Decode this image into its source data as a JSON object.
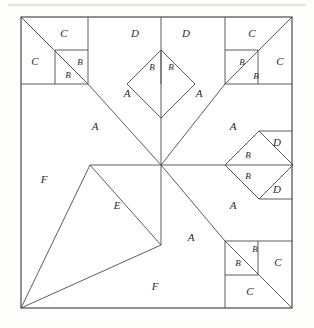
{
  "figure": {
    "background_color": "#fdfdfc",
    "line_color": "#3a3a3a",
    "label_color": "#2a2a2a",
    "outer_square": {
      "x": 21,
      "y": 17,
      "size": 271
    },
    "center_point": {
      "x": 161,
      "y": 165
    },
    "top_rule_y": 5
  },
  "labels": [
    {
      "id": "l01",
      "text": "C",
      "x": 64,
      "y": 34,
      "size": "normal"
    },
    {
      "id": "l02",
      "text": "C",
      "x": 35,
      "y": 62,
      "size": "normal"
    },
    {
      "id": "l03",
      "text": "B",
      "x": 80,
      "y": 63,
      "size": "small"
    },
    {
      "id": "l04",
      "text": "B",
      "x": 68,
      "y": 76,
      "size": "small"
    },
    {
      "id": "l05",
      "text": "D",
      "x": 135,
      "y": 34,
      "size": "normal"
    },
    {
      "id": "l06",
      "text": "D",
      "x": 186,
      "y": 34,
      "size": "normal"
    },
    {
      "id": "l07",
      "text": "B",
      "x": 153,
      "y": 67,
      "size": "small"
    },
    {
      "id": "l08",
      "text": "B",
      "x": 171,
      "y": 67,
      "size": "small"
    },
    {
      "id": "l09",
      "text": "C",
      "x": 252,
      "y": 34,
      "size": "normal"
    },
    {
      "id": "l10",
      "text": "C",
      "x": 280,
      "y": 62,
      "size": "normal"
    },
    {
      "id": "l11",
      "text": "B",
      "x": 243,
      "y": 63,
      "size": "small"
    },
    {
      "id": "l12",
      "text": "B",
      "x": 256,
      "y": 77,
      "size": "small"
    },
    {
      "id": "l13",
      "text": "A",
      "x": 127,
      "y": 94,
      "size": "normal"
    },
    {
      "id": "l14",
      "text": "A",
      "x": 199,
      "y": 94,
      "size": "normal"
    },
    {
      "id": "l15",
      "text": "A",
      "x": 95,
      "y": 127,
      "size": "normal"
    },
    {
      "id": "l16",
      "text": "A",
      "x": 233,
      "y": 127,
      "size": "normal"
    },
    {
      "id": "l17",
      "text": "D",
      "x": 277,
      "y": 143,
      "size": "normal"
    },
    {
      "id": "l18",
      "text": "B",
      "x": 240,
      "y": 156,
      "size": "small"
    },
    {
      "id": "l19",
      "text": "B",
      "x": 240,
      "y": 176,
      "size": "small"
    },
    {
      "id": "l20",
      "text": "D",
      "x": 277,
      "y": 190,
      "size": "normal"
    },
    {
      "id": "l21",
      "text": "F",
      "x": 44,
      "y": 180,
      "size": "normal"
    },
    {
      "id": "l22",
      "text": "E",
      "x": 117,
      "y": 206,
      "size": "normal"
    },
    {
      "id": "l23",
      "text": "A",
      "x": 192,
      "y": 206,
      "size": "normal"
    },
    {
      "id": "l24",
      "text": "A",
      "x": 191,
      "y": 238,
      "size": "normal"
    },
    {
      "id": "l25",
      "text": "B",
      "x": 257,
      "y": 250,
      "size": "small"
    },
    {
      "id": "l26",
      "text": "B",
      "x": 240,
      "y": 264,
      "size": "small"
    },
    {
      "id": "l27",
      "text": "C",
      "x": 278,
      "y": 263,
      "size": "normal"
    },
    {
      "id": "l28",
      "text": "C",
      "x": 250,
      "y": 292,
      "size": "normal"
    },
    {
      "id": "l29",
      "text": "F",
      "x": 155,
      "y": 287,
      "size": "normal"
    }
  ],
  "paths": {
    "outer_border": "M21,17 L292,17 L292,308 L21,308 Z",
    "top_rule": "M8,5 L306,5",
    "tl_square_box": "M21,84 L88,84 L88,17",
    "tl_diagonal": "M21,17 L88,84",
    "tl_inner_square": "M55,50 L88,50 L88,84 L55,84 Z",
    "tr_square_box": "M292,84 L225,84 L225,17",
    "tr_diagonal": "M292,17 L225,84",
    "tr_inner_square": "M225,50 L258,50 L258,84 L225,84 Z",
    "br_square_box": "M292,241 L225,241 L225,308",
    "br_diagonal": "M292,308 L225,241",
    "br_inner_square": "M225,241 L258,241 L258,275 L225,275 Z",
    "center_diamond_top": "M161,50 L195,84 L161,118 L127,84 Z",
    "center_diamond_top_split": "M161,50 L161,118",
    "right_diamond": "M225,165 L259,131 L293,165 L259,199 Z",
    "right_diamond_split": "M225,165 L293,165",
    "spoke_up": "M161,165 L161,17",
    "spoke_down": "M161,165 L161,245",
    "spoke_left": "M161,165 L90,165",
    "spoke_right": "M161,165 L225,165",
    "spoke_ul": "M161,165 L88,84",
    "spoke_ur": "M161,165 L225,84",
    "spoke_dr": "M161,165 L225,241",
    "spoke_dl_f": "M161,245 L21,308",
    "edge_f_left": "M90,165 L21,308",
    "edge_e_fold": "M161,245 L90,165",
    "top_divider_left": "M88,17 L88,84",
    "top_divider_right": "M225,17 L225,84",
    "right_divider_top": "M292,84 L225,84",
    "left_divider_top": "M21,84 L88,84",
    "br_bottom_divider": "M225,308 L225,241",
    "right_mid_line": "M259,165 L292,165",
    "diamond_d_upper": "M259,131 L292,131",
    "diamond_d_lower": "M259,199 L292,199",
    "br_col_divider": "M258,241 L258,308",
    "br_row_divider": "M225,275 L258,275",
    "tl_inner_v": "M55,50 L55,84",
    "tl_inner_h": "M55,50 L88,50",
    "tr_inner_v": "M258,50 L258,84",
    "tr_inner_h": "M225,50 L258,50",
    "d_band_left": "M88,84 L127,84",
    "d_band_right": "M195,84 L225,84"
  }
}
